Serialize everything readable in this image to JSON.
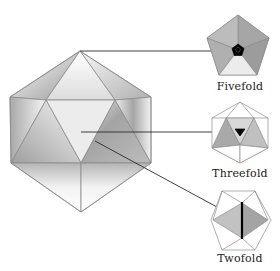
{
  "labels": {
    "fivefold": "Fivefold",
    "threefold": "Threefold",
    "twofold": "Twofold"
  },
  "colors": {
    "edge": "#8a8a8a",
    "pointer": "#2a2a2a",
    "face_light": "#f2f2f2",
    "face_mid": "#c8c8c8",
    "face_dark": "#a8a8a8",
    "marker": "#000000"
  },
  "icons": {
    "main": "icosahedron",
    "fivefold": "pentagon-fivefold-axis",
    "threefold": "triangle-threefold-axis",
    "twofold": "edge-twofold-axis"
  }
}
